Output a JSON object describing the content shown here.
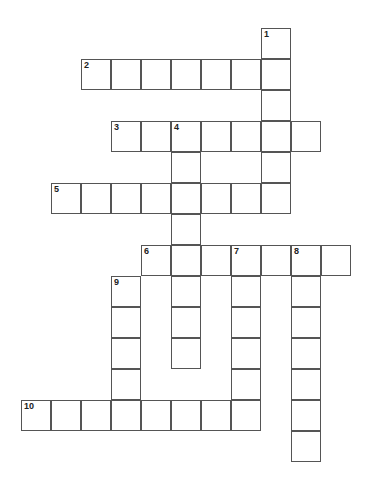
{
  "puzzle": {
    "type": "crossword",
    "cell_size": [
      30,
      31
    ],
    "origin": [
      21,
      28
    ],
    "words": [
      {
        "number": "1",
        "direction": "down",
        "col": 8,
        "row": 0,
        "length": 6
      },
      {
        "number": "2",
        "direction": "across",
        "col": 2,
        "row": 1,
        "length": 7
      },
      {
        "number": "3",
        "direction": "across",
        "col": 3,
        "row": 3,
        "length": 7
      },
      {
        "number": "4",
        "direction": "down",
        "col": 5,
        "row": 3,
        "length": 8
      },
      {
        "number": "5",
        "direction": "across",
        "col": 1,
        "row": 5,
        "length": 8
      },
      {
        "number": "6",
        "direction": "across",
        "col": 4,
        "row": 7,
        "length": 7
      },
      {
        "number": "7",
        "direction": "down",
        "col": 7,
        "row": 7,
        "length": 6
      },
      {
        "number": "8",
        "direction": "down",
        "col": 9,
        "row": 7,
        "length": 7
      },
      {
        "number": "9",
        "direction": "down",
        "col": 3,
        "row": 8,
        "length": 5
      },
      {
        "number": "10",
        "direction": "across",
        "col": 0,
        "row": 12,
        "length": 8
      }
    ]
  }
}
